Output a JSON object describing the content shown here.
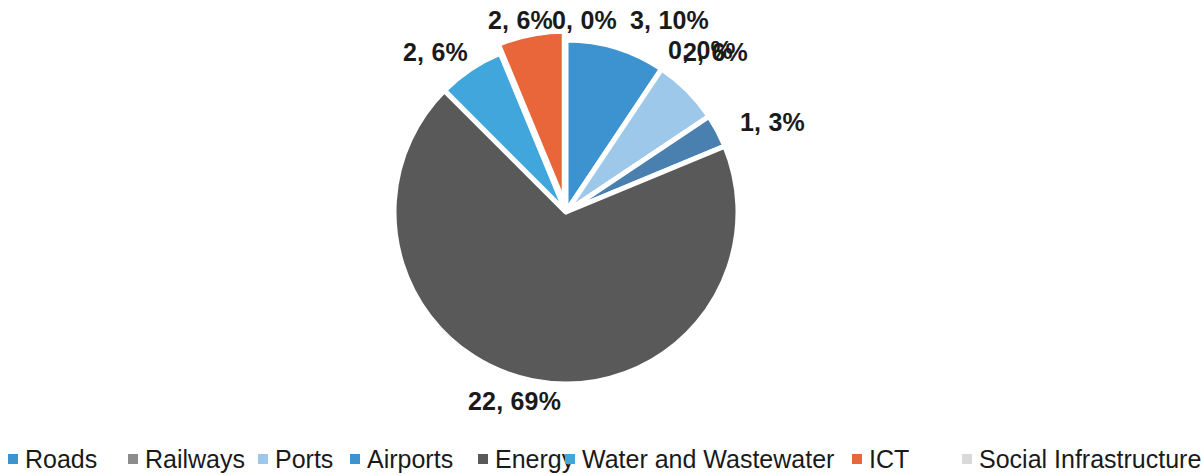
{
  "chart_data": {
    "type": "pie",
    "title": "",
    "subtitle": "",
    "xlabel": "",
    "ylabel": "",
    "legend_position": "bottom",
    "grid": false,
    "labels_show_value_and_percent": true,
    "categories": [
      "Roads",
      "Railways",
      "Ports",
      "Airports",
      "Energy",
      "Water and Wastewater",
      "ICT",
      "Social Infrastructure"
    ],
    "values": [
      3,
      0,
      2,
      1,
      22,
      2,
      2,
      0
    ],
    "percents": [
      10,
      0,
      6,
      3,
      69,
      6,
      6,
      0
    ],
    "data_labels": [
      "3, 10%",
      "0, 0%",
      "2, 6%",
      "1, 3%",
      "22, 69%",
      "2, 6%",
      "2, 6%",
      "0, 0%"
    ],
    "colors": [
      "#3d93cf",
      "#8c8c8c",
      "#9dc8ea",
      "#4a80b0",
      "#595959",
      "#41a6dc",
      "#e8663a",
      "#d9d9d9"
    ],
    "total": 32,
    "exploded_slices": [
      "ICT"
    ],
    "slices": [
      {
        "name": "Roads",
        "value": 3,
        "percent": 10,
        "label": "3, 10%",
        "color": "#3d93cf"
      },
      {
        "name": "Railways",
        "value": 0,
        "percent": 0,
        "label": "0, 0%",
        "color": "#8c8c8c"
      },
      {
        "name": "Ports",
        "value": 2,
        "percent": 6,
        "label": "2, 6%",
        "color": "#9dc8ea"
      },
      {
        "name": "Airports",
        "value": 1,
        "percent": 3,
        "label": "1, 3%",
        "color": "#4a80b0"
      },
      {
        "name": "Energy",
        "value": 22,
        "percent": 69,
        "label": "22, 69%",
        "color": "#595959"
      },
      {
        "name": "Water and Wastewater",
        "value": 2,
        "percent": 6,
        "label": "2, 6%",
        "color": "#41a6dc"
      },
      {
        "name": "ICT",
        "value": 2,
        "percent": 6,
        "label": "2, 6%",
        "color": "#e8663a"
      },
      {
        "name": "Social Infrastructure",
        "value": 0,
        "percent": 0,
        "label": "0, 0%",
        "color": "#d9d9d9"
      }
    ]
  },
  "labels": {
    "roads": "3, 10%",
    "railways": "0, 0%",
    "ports": "2, 6%",
    "airports": "1, 3%",
    "energy": "22, 69%",
    "water": "2, 6%",
    "ict": "2, 6%",
    "social": "0, 0%"
  },
  "legend": {
    "items": [
      {
        "label": "Roads",
        "color": "#3d93cf"
      },
      {
        "label": "Railways",
        "color": "#8c8c8c"
      },
      {
        "label": "Ports",
        "color": "#9dc8ea"
      },
      {
        "label": "Airports",
        "color": "#3d93cf"
      },
      {
        "label": "Energy",
        "color": "#595959"
      },
      {
        "label": "Water and Wastewater",
        "color": "#41a6dc"
      },
      {
        "label": "ICT",
        "color": "#e8663a"
      },
      {
        "label": "Social Infrastructure",
        "color": "#d9d9d9"
      }
    ]
  }
}
